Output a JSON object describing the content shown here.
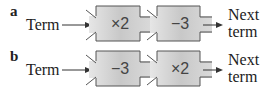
{
  "diagrams": [
    {
      "label": "a",
      "input": "Term",
      "machines": [
        {
          "op": "×2"
        },
        {
          "op": "−3"
        }
      ],
      "output_line1": "Next",
      "output_line2": "term"
    },
    {
      "label": "b",
      "input": "Term",
      "machines": [
        {
          "op": "−3"
        },
        {
          "op": "×2"
        }
      ],
      "output_line1": "Next",
      "output_line2": "term"
    }
  ],
  "colors": {
    "box_fill": "#cfcfcf",
    "box_stroke": "#555555",
    "text": "#222222"
  }
}
